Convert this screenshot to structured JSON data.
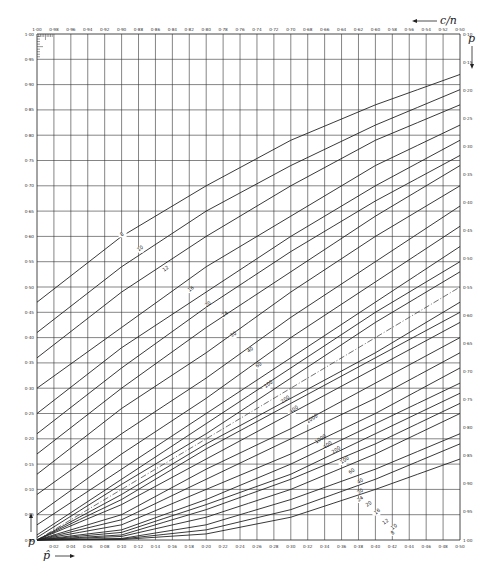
{
  "chart_data": {
    "type": "line",
    "title": "",
    "subtitle": "Confidence limits for a proportion (nomogram)",
    "xlabel": "p̂",
    "ylabel": "p",
    "top_axis_label": "c/n",
    "right_axis_label": "p",
    "xlim": [
      0,
      0.5
    ],
    "ylim": [
      0,
      1
    ],
    "grid": true,
    "x_ticks": [
      "0·02",
      "0·04",
      "0·06",
      "0·08",
      "0·10",
      "0·12",
      "0·14",
      "0·16",
      "0·18",
      "0·20",
      "0·22",
      "0·24",
      "0·26",
      "0·28",
      "0·30",
      "0·32",
      "0·34",
      "0·36",
      "0·38",
      "0·40",
      "0·42",
      "0·44",
      "0·46",
      "0·48",
      "0·50"
    ],
    "top_ticks": [
      "1·00",
      "0·98",
      "0·96",
      "0·94",
      "0·92",
      "0·90",
      "0·88",
      "0·86",
      "0·84",
      "0·82",
      "0·80",
      "0·78",
      "0·76",
      "0·74",
      "0·72",
      "0·70",
      "0·68",
      "0·66",
      "0·64",
      "0·62",
      "0·60",
      "0·58",
      "0·56",
      "0·54",
      "0·52",
      "0·50"
    ],
    "y_ticks_left": [
      "1·00",
      "0·95",
      "0·90",
      "0·85",
      "0·80",
      "0·75",
      "0·70",
      "0·65",
      "0·60",
      "0·55",
      "0·50",
      "0·45",
      "0·40",
      "0·35",
      "0·30",
      "0·25",
      "0·20",
      "0·15",
      "0·10",
      "0·05",
      "0·00"
    ],
    "y_ticks_right": [
      "0·50",
      "0·45",
      "0·40",
      "0·35",
      "0·30",
      "0·25",
      "0·20",
      "0·15",
      "0·10",
      "0·05",
      "0·00"
    ],
    "y_ticks_right_visible": [
      "0·10",
      "0·15",
      "0·20",
      "0·25",
      "0·30",
      "0·35",
      "0·40",
      "0·45",
      "0·50",
      "0·55",
      "0·60",
      "0·65",
      "0·70",
      "0·75",
      "0·80",
      "0·85",
      "0·90",
      "0·95",
      "1·00"
    ],
    "diagonal": {
      "style": "dash-dot",
      "points": [
        [
          0,
          0
        ],
        [
          0.5,
          0.5
        ]
      ]
    },
    "series_upper": [
      {
        "name": "8",
        "label_at": [
          0.1,
          0.6
        ],
        "points": [
          [
            0,
            0.47
          ],
          [
            0.1,
            0.6
          ],
          [
            0.2,
            0.7
          ],
          [
            0.3,
            0.79
          ],
          [
            0.4,
            0.86
          ],
          [
            0.5,
            0.92
          ]
        ]
      },
      {
        "name": "10",
        "label_at": [
          0.12,
          0.57
        ],
        "points": [
          [
            0,
            0.41
          ],
          [
            0.1,
            0.54
          ],
          [
            0.2,
            0.65
          ],
          [
            0.3,
            0.74
          ],
          [
            0.4,
            0.82
          ],
          [
            0.5,
            0.89
          ]
        ]
      },
      {
        "name": "12",
        "label_at": [
          0.15,
          0.53
        ],
        "points": [
          [
            0,
            0.36
          ],
          [
            0.1,
            0.49
          ],
          [
            0.2,
            0.6
          ],
          [
            0.3,
            0.7
          ],
          [
            0.4,
            0.79
          ],
          [
            0.5,
            0.86
          ]
        ]
      },
      {
        "name": "16",
        "label_at": [
          0.18,
          0.49
        ],
        "points": [
          [
            0,
            0.3
          ],
          [
            0.1,
            0.42
          ],
          [
            0.2,
            0.54
          ],
          [
            0.3,
            0.64
          ],
          [
            0.4,
            0.74
          ],
          [
            0.5,
            0.82
          ]
        ]
      },
      {
        "name": "20",
        "label_at": [
          0.2,
          0.46
        ],
        "points": [
          [
            0,
            0.25
          ],
          [
            0.1,
            0.38
          ],
          [
            0.2,
            0.49
          ],
          [
            0.3,
            0.6
          ],
          [
            0.4,
            0.7
          ],
          [
            0.5,
            0.79
          ]
        ]
      },
      {
        "name": "24",
        "label_at": [
          0.22,
          0.44
        ],
        "points": [
          [
            0,
            0.21
          ],
          [
            0.1,
            0.34
          ],
          [
            0.2,
            0.46
          ],
          [
            0.3,
            0.57
          ],
          [
            0.4,
            0.67
          ],
          [
            0.5,
            0.76
          ]
        ]
      },
      {
        "name": "30",
        "label_at": [
          0.23,
          0.4
        ],
        "points": [
          [
            0,
            0.17
          ],
          [
            0.1,
            0.3
          ],
          [
            0.2,
            0.42
          ],
          [
            0.3,
            0.53
          ],
          [
            0.4,
            0.64
          ],
          [
            0.5,
            0.74
          ]
        ]
      },
      {
        "name": "40",
        "label_at": [
          0.25,
          0.37
        ],
        "points": [
          [
            0,
            0.13
          ],
          [
            0.1,
            0.26
          ],
          [
            0.2,
            0.37
          ],
          [
            0.3,
            0.49
          ],
          [
            0.4,
            0.6
          ],
          [
            0.5,
            0.7
          ]
        ]
      },
      {
        "name": "60",
        "label_at": [
          0.26,
          0.34
        ],
        "points": [
          [
            0,
            0.09
          ],
          [
            0.1,
            0.21
          ],
          [
            0.2,
            0.32
          ],
          [
            0.3,
            0.44
          ],
          [
            0.4,
            0.55
          ],
          [
            0.5,
            0.66
          ]
        ]
      },
      {
        "name": "100",
        "label_at": [
          0.27,
          0.3
        ],
        "points": [
          [
            0,
            0.05
          ],
          [
            0.1,
            0.17
          ],
          [
            0.2,
            0.28
          ],
          [
            0.3,
            0.4
          ],
          [
            0.4,
            0.51
          ],
          [
            0.5,
            0.62
          ]
        ]
      },
      {
        "name": "200",
        "label_at": [
          0.29,
          0.27
        ],
        "points": [
          [
            0,
            0.03
          ],
          [
            0.1,
            0.14
          ],
          [
            0.2,
            0.25
          ],
          [
            0.3,
            0.36
          ],
          [
            0.4,
            0.47
          ],
          [
            0.5,
            0.58
          ]
        ]
      },
      {
        "name": "400",
        "label_at": [
          0.3,
          0.25
        ],
        "points": [
          [
            0,
            0.01
          ],
          [
            0.1,
            0.12
          ],
          [
            0.2,
            0.23
          ],
          [
            0.3,
            0.34
          ],
          [
            0.4,
            0.45
          ],
          [
            0.5,
            0.55
          ]
        ]
      },
      {
        "name": "1000",
        "label_at": [
          0.32,
          0.23
        ],
        "points": [
          [
            0,
            0.005
          ],
          [
            0.1,
            0.11
          ],
          [
            0.2,
            0.21
          ],
          [
            0.3,
            0.32
          ],
          [
            0.4,
            0.43
          ],
          [
            0.5,
            0.53
          ]
        ]
      }
    ],
    "series_lower": [
      {
        "name": "1000",
        "label_at": [
          0.33,
          0.19
        ],
        "points": [
          [
            0,
            0
          ],
          [
            0.1,
            0.09
          ],
          [
            0.2,
            0.19
          ],
          [
            0.3,
            0.28
          ],
          [
            0.4,
            0.37
          ],
          [
            0.5,
            0.47
          ]
        ]
      },
      {
        "name": "400",
        "label_at": [
          0.34,
          0.18
        ],
        "points": [
          [
            0,
            0
          ],
          [
            0.1,
            0.08
          ],
          [
            0.2,
            0.18
          ],
          [
            0.3,
            0.27
          ],
          [
            0.4,
            0.36
          ],
          [
            0.5,
            0.45
          ]
        ]
      },
      {
        "name": "200",
        "label_at": [
          0.35,
          0.17
        ],
        "points": [
          [
            0,
            0
          ],
          [
            0.1,
            0.07
          ],
          [
            0.2,
            0.16
          ],
          [
            0.3,
            0.25
          ],
          [
            0.4,
            0.34
          ],
          [
            0.5,
            0.43
          ]
        ]
      },
      {
        "name": "100",
        "label_at": [
          0.36,
          0.15
        ],
        "points": [
          [
            0,
            0
          ],
          [
            0.1,
            0.05
          ],
          [
            0.2,
            0.14
          ],
          [
            0.3,
            0.22
          ],
          [
            0.4,
            0.31
          ],
          [
            0.5,
            0.4
          ]
        ]
      },
      {
        "name": "60",
        "label_at": [
          0.37,
          0.13
        ],
        "points": [
          [
            0,
            0
          ],
          [
            0.1,
            0.04
          ],
          [
            0.2,
            0.12
          ],
          [
            0.3,
            0.2
          ],
          [
            0.4,
            0.28
          ],
          [
            0.5,
            0.37
          ]
        ]
      },
      {
        "name": "40",
        "label_at": [
          0.38,
          0.11
        ],
        "points": [
          [
            0,
            0
          ],
          [
            0.1,
            0.03
          ],
          [
            0.2,
            0.1
          ],
          [
            0.3,
            0.17
          ],
          [
            0.4,
            0.25
          ],
          [
            0.5,
            0.34
          ]
        ]
      },
      {
        "name": "30",
        "label_at": [
          0.38,
          0.09
        ],
        "points": [
          [
            0,
            0
          ],
          [
            0.1,
            0.02
          ],
          [
            0.2,
            0.08
          ],
          [
            0.3,
            0.15
          ],
          [
            0.4,
            0.23
          ],
          [
            0.5,
            0.31
          ]
        ]
      },
      {
        "name": "24",
        "label_at": [
          0.38,
          0.075
        ],
        "points": [
          [
            0,
            0
          ],
          [
            0.1,
            0.015
          ],
          [
            0.2,
            0.07
          ],
          [
            0.3,
            0.13
          ],
          [
            0.4,
            0.21
          ],
          [
            0.5,
            0.29
          ]
        ]
      },
      {
        "name": "20",
        "label_at": [
          0.39,
          0.065
        ],
        "points": [
          [
            0,
            0
          ],
          [
            0.1,
            0.01
          ],
          [
            0.2,
            0.06
          ],
          [
            0.3,
            0.12
          ],
          [
            0.4,
            0.19
          ],
          [
            0.5,
            0.27
          ]
        ]
      },
      {
        "name": "16",
        "label_at": [
          0.4,
          0.05
        ],
        "points": [
          [
            0,
            0
          ],
          [
            0.1,
            0.007
          ],
          [
            0.2,
            0.045
          ],
          [
            0.3,
            0.1
          ],
          [
            0.4,
            0.17
          ],
          [
            0.5,
            0.25
          ]
        ]
      },
      {
        "name": "12",
        "label_at": [
          0.41,
          0.03
        ],
        "points": [
          [
            0,
            0
          ],
          [
            0.1,
            0.003
          ],
          [
            0.2,
            0.03
          ],
          [
            0.3,
            0.08
          ],
          [
            0.4,
            0.14
          ],
          [
            0.5,
            0.21
          ]
        ]
      },
      {
        "name": "10",
        "label_at": [
          0.42,
          0.02
        ],
        "points": [
          [
            0,
            0
          ],
          [
            0.1,
            0.002
          ],
          [
            0.2,
            0.02
          ],
          [
            0.3,
            0.06
          ],
          [
            0.4,
            0.12
          ],
          [
            0.5,
            0.19
          ]
        ]
      },
      {
        "name": "8",
        "label_at": [
          0.42,
          0.01
        ],
        "points": [
          [
            0,
            0
          ],
          [
            0.1,
            0.001
          ],
          [
            0.2,
            0.012
          ],
          [
            0.3,
            0.045
          ],
          [
            0.4,
            0.1
          ],
          [
            0.5,
            0.16
          ]
        ]
      }
    ]
  },
  "labels": {
    "top_axis": "c/n",
    "right_axis": "p",
    "left_axis": "p",
    "bottom_axis": "p̂"
  }
}
